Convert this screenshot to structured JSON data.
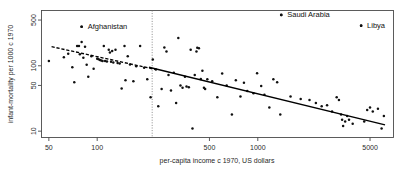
{
  "chart_data": {
    "type": "scatter",
    "title": "",
    "xlabel": "per-capita income c 1970, US dollars",
    "ylabel": "infant-mortality per 1000 c 1970",
    "xscale": "log",
    "yscale": "log",
    "xlim": [
      45,
      7000
    ],
    "ylim": [
      8,
      700
    ],
    "grid": false,
    "legend": null,
    "xticks": [
      50,
      100,
      500,
      1000,
      5000
    ],
    "xticklabels": [
      "50",
      "100",
      "500",
      "1000",
      "5000"
    ],
    "yticks": [
      10,
      50,
      100,
      500
    ],
    "yticklabels": [
      "10",
      "50",
      "100",
      "500"
    ],
    "annotations": [
      {
        "label": "Afghanistan",
        "x": 80,
        "y": 395,
        "label_dx": 6,
        "label_dy": 2
      },
      {
        "label": "Saudi Arabia",
        "x": 1400,
        "y": 600,
        "label_dx": 6,
        "label_dy": 2
      },
      {
        "label": "Libya",
        "x": 4400,
        "y": 410,
        "label_dx": 6,
        "label_dy": 2
      }
    ],
    "reference_line": {
      "orientation": "vertical",
      "x": 220,
      "style": "dotted"
    },
    "fit_lines": [
      {
        "name": "regression-dashed-segment",
        "style": "dashed",
        "x_start": 52,
        "y_start": 196,
        "x_end": 230,
        "y_end": 88
      },
      {
        "name": "regression-solid-segment",
        "style": "solid",
        "x_start": 210,
        "y_start": 95,
        "x_end": 6200,
        "y_end": 12.5
      }
    ],
    "points": [
      {
        "x": 50,
        "y": 118
      },
      {
        "x": 62,
        "y": 135
      },
      {
        "x": 66,
        "y": 152
      },
      {
        "x": 70,
        "y": 95
      },
      {
        "x": 72,
        "y": 56
      },
      {
        "x": 75,
        "y": 200
      },
      {
        "x": 77,
        "y": 200
      },
      {
        "x": 78,
        "y": 150
      },
      {
        "x": 80,
        "y": 395
      },
      {
        "x": 80,
        "y": 230
      },
      {
        "x": 82,
        "y": 133
      },
      {
        "x": 84,
        "y": 195
      },
      {
        "x": 86,
        "y": 104
      },
      {
        "x": 88,
        "y": 68
      },
      {
        "x": 92,
        "y": 140
      },
      {
        "x": 95,
        "y": 90
      },
      {
        "x": 100,
        "y": 128
      },
      {
        "x": 102,
        "y": 126
      },
      {
        "x": 104,
        "y": 122
      },
      {
        "x": 106,
        "y": 120
      },
      {
        "x": 108,
        "y": 118
      },
      {
        "x": 110,
        "y": 200
      },
      {
        "x": 112,
        "y": 118
      },
      {
        "x": 115,
        "y": 116
      },
      {
        "x": 118,
        "y": 175
      },
      {
        "x": 120,
        "y": 160
      },
      {
        "x": 122,
        "y": 115
      },
      {
        "x": 124,
        "y": 168
      },
      {
        "x": 126,
        "y": 112
      },
      {
        "x": 130,
        "y": 175
      },
      {
        "x": 134,
        "y": 110
      },
      {
        "x": 138,
        "y": 108
      },
      {
        "x": 142,
        "y": 45
      },
      {
        "x": 148,
        "y": 200
      },
      {
        "x": 150,
        "y": 60
      },
      {
        "x": 155,
        "y": 140
      },
      {
        "x": 160,
        "y": 105
      },
      {
        "x": 168,
        "y": 58
      },
      {
        "x": 175,
        "y": 98
      },
      {
        "x": 185,
        "y": 200
      },
      {
        "x": 196,
        "y": 93
      },
      {
        "x": 205,
        "y": 62
      },
      {
        "x": 215,
        "y": 33
      },
      {
        "x": 222,
        "y": 125
      },
      {
        "x": 232,
        "y": 88
      },
      {
        "x": 240,
        "y": 24
      },
      {
        "x": 252,
        "y": 44
      },
      {
        "x": 262,
        "y": 190
      },
      {
        "x": 270,
        "y": 165
      },
      {
        "x": 278,
        "y": 72
      },
      {
        "x": 288,
        "y": 42
      },
      {
        "x": 300,
        "y": 78
      },
      {
        "x": 310,
        "y": 27
      },
      {
        "x": 320,
        "y": 265
      },
      {
        "x": 330,
        "y": 50
      },
      {
        "x": 340,
        "y": 46
      },
      {
        "x": 352,
        "y": 68
      },
      {
        "x": 360,
        "y": 48
      },
      {
        "x": 372,
        "y": 47
      },
      {
        "x": 382,
        "y": 175
      },
      {
        "x": 392,
        "y": 11
      },
      {
        "x": 405,
        "y": 72
      },
      {
        "x": 415,
        "y": 165
      },
      {
        "x": 420,
        "y": 188
      },
      {
        "x": 430,
        "y": 185
      },
      {
        "x": 442,
        "y": 63
      },
      {
        "x": 452,
        "y": 84
      },
      {
        "x": 462,
        "y": 46
      },
      {
        "x": 470,
        "y": 44
      },
      {
        "x": 485,
        "y": 62
      },
      {
        "x": 520,
        "y": 58
      },
      {
        "x": 560,
        "y": 33
      },
      {
        "x": 600,
        "y": 76
      },
      {
        "x": 640,
        "y": 50
      },
      {
        "x": 690,
        "y": 18
      },
      {
        "x": 730,
        "y": 60
      },
      {
        "x": 780,
        "y": 34
      },
      {
        "x": 820,
        "y": 55
      },
      {
        "x": 860,
        "y": 41
      },
      {
        "x": 940,
        "y": 38
      },
      {
        "x": 990,
        "y": 77
      },
      {
        "x": 1050,
        "y": 49
      },
      {
        "x": 1100,
        "y": 36
      },
      {
        "x": 1180,
        "y": 23
      },
      {
        "x": 1250,
        "y": 62
      },
      {
        "x": 1320,
        "y": 56
      },
      {
        "x": 1380,
        "y": 18
      },
      {
        "x": 1400,
        "y": 600
      },
      {
        "x": 1600,
        "y": 34
      },
      {
        "x": 1850,
        "y": 31
      },
      {
        "x": 2100,
        "y": 30
      },
      {
        "x": 2300,
        "y": 27
      },
      {
        "x": 2500,
        "y": 24
      },
      {
        "x": 2700,
        "y": 25
      },
      {
        "x": 2900,
        "y": 20
      },
      {
        "x": 3100,
        "y": 33
      },
      {
        "x": 3200,
        "y": 30
      },
      {
        "x": 3300,
        "y": 18
      },
      {
        "x": 3350,
        "y": 15
      },
      {
        "x": 3400,
        "y": 12
      },
      {
        "x": 3500,
        "y": 14
      },
      {
        "x": 3600,
        "y": 17
      },
      {
        "x": 3700,
        "y": 15
      },
      {
        "x": 3900,
        "y": 13
      },
      {
        "x": 4400,
        "y": 410
      },
      {
        "x": 4600,
        "y": 14
      },
      {
        "x": 4800,
        "y": 21
      },
      {
        "x": 5000,
        "y": 23
      },
      {
        "x": 5200,
        "y": 20
      },
      {
        "x": 5600,
        "y": 22
      },
      {
        "x": 5900,
        "y": 11
      },
      {
        "x": 6100,
        "y": 17
      }
    ]
  }
}
